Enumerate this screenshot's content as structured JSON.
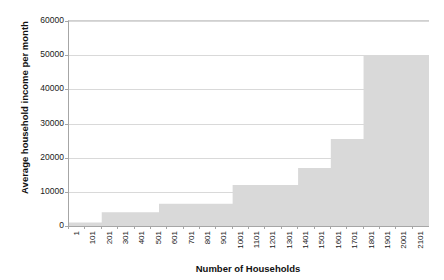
{
  "chart_data": {
    "type": "area",
    "title": "",
    "xlabel": "Number of Households",
    "ylabel": "Average household income per month",
    "grid": true,
    "legend": false,
    "legend_position": "none",
    "series_color": "#d9d9d9",
    "gridline_color": "#d9d9d9",
    "axis_color": "#a6a6a6",
    "background": "#ffffff",
    "xlim": [
      1,
      2101
    ],
    "ylim": [
      0,
      60000
    ],
    "ytick_values": [
      0,
      10000,
      20000,
      30000,
      40000,
      50000,
      60000
    ],
    "ytick_labels": [
      "0",
      "10000",
      "20000",
      "30000",
      "40000",
      "50000",
      "60000"
    ],
    "xtick_labels": [
      "1",
      "101",
      "201",
      "301",
      "401",
      "501",
      "601",
      "701",
      "801",
      "901",
      "1001",
      "1101",
      "1201",
      "1301",
      "1401",
      "1501",
      "1601",
      "1701",
      "1801",
      "1901",
      "2001",
      "2101"
    ],
    "xtick_values": [
      1,
      101,
      201,
      301,
      401,
      501,
      601,
      701,
      801,
      901,
      1001,
      1101,
      1201,
      1301,
      1401,
      1501,
      1601,
      1701,
      1801,
      1901,
      2001,
      2101
    ],
    "steps": [
      {
        "x_start": 1,
        "x_end": 201,
        "value": 1000
      },
      {
        "x_start": 201,
        "x_end": 551,
        "value": 4000
      },
      {
        "x_start": 551,
        "x_end": 1001,
        "value": 6500
      },
      {
        "x_start": 1001,
        "x_end": 1401,
        "value": 12000
      },
      {
        "x_start": 1401,
        "x_end": 1601,
        "value": 17000
      },
      {
        "x_start": 1601,
        "x_end": 1801,
        "value": 25500
      },
      {
        "x_start": 1801,
        "x_end": 2201,
        "value": 50000
      }
    ],
    "x": [
      1,
      201,
      551,
      1001,
      1401,
      1601,
      1801,
      2201
    ],
    "values": [
      1000,
      4000,
      6500,
      12000,
      17000,
      25500,
      50000,
      50000
    ]
  }
}
